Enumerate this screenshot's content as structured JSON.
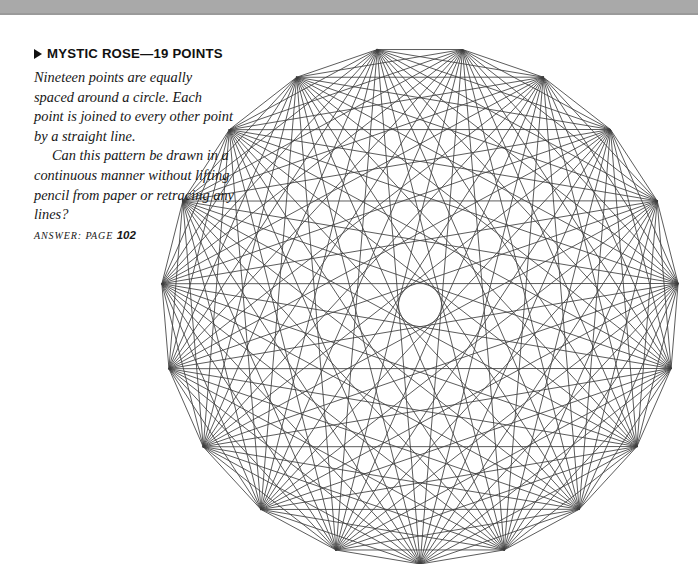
{
  "page": {
    "background_color": "#ffffff",
    "width": 698,
    "height": 564
  },
  "top_band": {
    "color": "#a9a9a9",
    "height": 15
  },
  "puzzle": {
    "bullet_glyph": "▶",
    "title": "MYSTIC ROSE—19 POINTS",
    "paragraph_1": "Nineteen points are equally spaced around a circle. Each point is joined to every other point by a straight line.",
    "paragraph_2": "Can this pattern be drawn in a continuous manner without lifting pencil from paper or retracing any lines?",
    "answer_label": "Answer:",
    "answer_page_word": "page",
    "answer_page_number": "102"
  },
  "figure": {
    "name": "mystic-rose",
    "point_count": 19,
    "center_x": 420,
    "center_y": 305,
    "radius": 259,
    "start_angle_deg": -99.5,
    "line_color": "#3f3f3f",
    "line_width": 0.85,
    "chord_count": 171
  },
  "chart_data": {
    "type": "scatter",
    "xlabel": "",
    "ylabel": "",
    "annotations": [
      "Nineteen points are equally spaced around a circle.",
      "Each point is joined to every other point by a straight line.",
      "Every pair of the 19 points is connected: 171 chords in total."
    ],
    "categories": [
      "P1",
      "P2",
      "P3",
      "P4",
      "P5",
      "P6",
      "P7",
      "P8",
      "P9",
      "P10",
      "P11",
      "P12",
      "P13",
      "P14",
      "P15",
      "P16",
      "P17",
      "P18",
      "P19"
    ],
    "values": [
      1,
      1,
      1,
      1,
      1,
      1,
      1,
      1,
      1,
      1,
      1,
      1,
      1,
      1,
      1,
      1,
      1,
      1,
      1
    ]
  }
}
